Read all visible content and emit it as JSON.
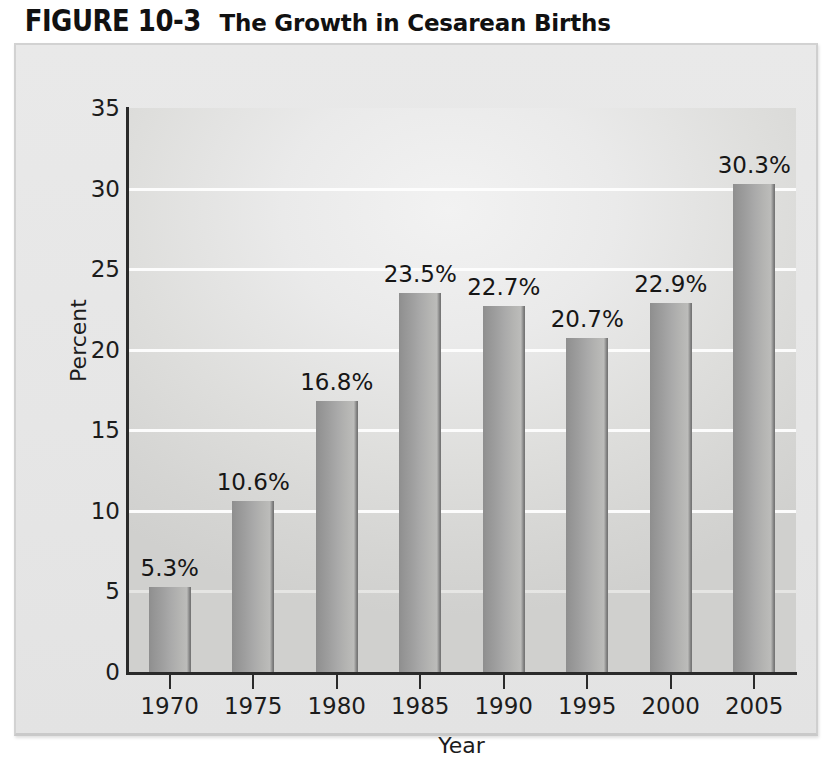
{
  "figure": {
    "number": "FIGURE 10-3",
    "title": "The Growth in Cesarean Births"
  },
  "chart_data": {
    "type": "bar",
    "title": "The Growth in Cesarean Births",
    "xlabel": "Year",
    "ylabel": "Percent",
    "categories": [
      "1970",
      "1975",
      "1980",
      "1985",
      "1990",
      "1995",
      "2000",
      "2005"
    ],
    "values": [
      5.3,
      10.6,
      16.8,
      23.5,
      22.7,
      20.7,
      22.9,
      30.3
    ],
    "data_labels": [
      "5.3%",
      "10.6%",
      "16.8%",
      "23.5%",
      "22.7%",
      "20.7%",
      "22.9%",
      "30.3%"
    ],
    "ylim": [
      0,
      35
    ],
    "yticks": [
      0,
      5,
      10,
      15,
      20,
      25,
      30,
      35
    ],
    "ytick_labels": [
      "0",
      "5",
      "10",
      "15",
      "20",
      "25",
      "30",
      "35"
    ],
    "grid": true,
    "grid_color": "#fdfdfd",
    "legend": null,
    "bar_color": "#a3a3a3",
    "plot_background": "#e4e4e2",
    "panel_background": "#e6e6e6"
  }
}
